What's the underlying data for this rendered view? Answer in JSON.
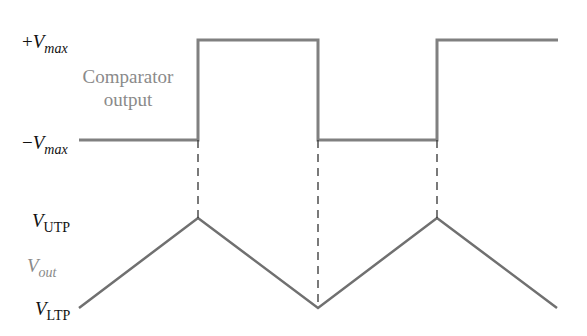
{
  "diagram": {
    "labels": {
      "pos_vmax": {
        "sign": "+",
        "var": "V",
        "sub": "max"
      },
      "neg_vmax": {
        "sign": "−",
        "var": "V",
        "sub": "max"
      },
      "comparator_line1": "Comparator",
      "comparator_line2": "output",
      "v_utp": {
        "var": "V",
        "sub": "UTP"
      },
      "v_out": {
        "var": "V",
        "sub": "out"
      },
      "v_ltp": {
        "var": "V",
        "sub": "LTP"
      }
    },
    "colors": {
      "waveform": "#808080",
      "label_dark": "#111111",
      "label_gray": "#8a8a8a"
    },
    "square_wave_points": "79,140 198,140 198,40 318,40 318,140 437,140 437,40 558,40",
    "triangle_wave_points": "79,308 198,218 318,308 437,218 557,308",
    "dashed_guides": [
      {
        "x": 198,
        "y1": 140,
        "y2": 218
      },
      {
        "x": 318,
        "y1": 140,
        "y2": 308
      },
      {
        "x": 437,
        "y1": 140,
        "y2": 218
      }
    ]
  }
}
